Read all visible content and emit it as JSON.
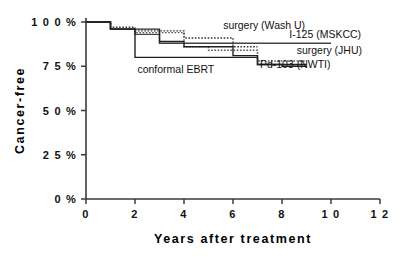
{
  "chart_data": {
    "type": "line",
    "subtype": "kaplan-meier-step",
    "title": "",
    "xlabel": "Years after treatment",
    "ylabel": "Cancer-free",
    "xlim": [
      0,
      12
    ],
    "ylim": [
      0,
      100
    ],
    "xticks": [
      0,
      2,
      4,
      6,
      8,
      10,
      12
    ],
    "xticklabels": [
      "0",
      "2",
      "4",
      "6",
      "8",
      "1 0",
      "1 2"
    ],
    "yticks": [
      0,
      25,
      50,
      75,
      100
    ],
    "yticklabels": [
      "0 %",
      "2 5 %",
      "5 0 %",
      "7 5 %",
      "1 0 0 %"
    ],
    "grid": false,
    "legend_position": "inline-annotations",
    "y_unit": "percent",
    "series": [
      {
        "name": "surgery (Wash U)",
        "style": "dotted",
        "color": "#333333",
        "label_x": 5.6,
        "label_y": 96,
        "points": [
          [
            0,
            100
          ],
          [
            1,
            100
          ],
          [
            1,
            97
          ],
          [
            2,
            97
          ],
          [
            2,
            95
          ],
          [
            4,
            95
          ],
          [
            4,
            91
          ],
          [
            6,
            91
          ],
          [
            6,
            86
          ],
          [
            7,
            86
          ]
        ]
      },
      {
        "name": "I-125 (MSKCC)",
        "style": "solid",
        "color": "#444444",
        "label_x": 8.3,
        "label_y": 91,
        "points": [
          [
            0,
            100
          ],
          [
            1,
            100
          ],
          [
            1,
            96
          ],
          [
            2,
            96
          ],
          [
            2,
            93
          ],
          [
            3,
            93
          ],
          [
            3,
            88
          ],
          [
            10,
            88
          ]
        ]
      },
      {
        "name": "surgery (JHU)",
        "style": "dotted",
        "color": "#555555",
        "label_x": 8.6,
        "label_y": 82,
        "points": [
          [
            0,
            100
          ],
          [
            1,
            100
          ],
          [
            1,
            96
          ],
          [
            2,
            96
          ],
          [
            2,
            94
          ],
          [
            4,
            94
          ],
          [
            4,
            86
          ],
          [
            5,
            86
          ],
          [
            5,
            84
          ],
          [
            7,
            84
          ],
          [
            7,
            78
          ],
          [
            9,
            78
          ]
        ]
      },
      {
        "name": "Pd-103 (NWTI)",
        "style": "solid",
        "color": "#222222",
        "label_x": 7.1,
        "label_y": 74,
        "points": [
          [
            0,
            100
          ],
          [
            1,
            100
          ],
          [
            1,
            96
          ],
          [
            3,
            96
          ],
          [
            3,
            89
          ],
          [
            4,
            89
          ],
          [
            4,
            86
          ],
          [
            6,
            86
          ],
          [
            6,
            81
          ],
          [
            7,
            81
          ],
          [
            7,
            76
          ],
          [
            9,
            76
          ]
        ]
      },
      {
        "name": "conformal EBRT",
        "style": "solid",
        "color": "#222222",
        "label_x": 2.1,
        "label_y": 71,
        "points": [
          [
            0,
            100
          ],
          [
            1,
            100
          ],
          [
            1,
            96
          ],
          [
            2,
            96
          ],
          [
            2,
            80
          ],
          [
            7,
            80
          ],
          [
            7,
            76
          ],
          [
            8,
            76
          ],
          [
            8,
            75
          ],
          [
            9,
            75
          ]
        ]
      }
    ]
  }
}
